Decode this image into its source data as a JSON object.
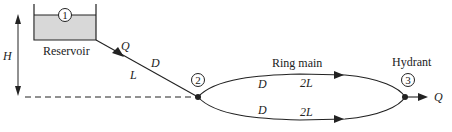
{
  "diagram": {
    "reservoir": {
      "label": "Reservoir",
      "node": "1",
      "fill": "#d8d8d8"
    },
    "height_label": "H",
    "pipe1": {
      "flow_label": "Q",
      "diameter_label": "D",
      "length_label": "L"
    },
    "junction": {
      "node": "2"
    },
    "ring_main": {
      "label": "Ring main",
      "upper": {
        "diameter_label": "D",
        "length_label": "2L"
      },
      "lower": {
        "diameter_label": "D",
        "length_label": "2L"
      }
    },
    "hydrant": {
      "label": "Hydrant",
      "node": "3",
      "outflow_label": "Q"
    },
    "colors": {
      "line": "#222222",
      "reservoir_fill": "#d8d8d8"
    }
  }
}
